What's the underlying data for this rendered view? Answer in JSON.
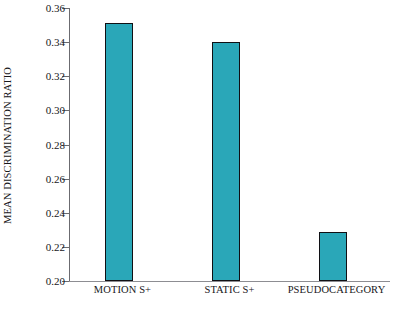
{
  "chart_data": {
    "type": "bar",
    "title": "",
    "xlabel": "",
    "ylabel": "MEAN DISCRIMINATION RATIO",
    "categories": [
      "MOTION S+",
      "STATIC S+",
      "PSEUDOCATEGORY"
    ],
    "values": [
      0.351,
      0.34,
      0.229
    ],
    "ylim": [
      0.2,
      0.36
    ],
    "ytick_step": 0.02,
    "ytick_labels": [
      "0.20",
      "0.22",
      "0.24",
      "0.26",
      "0.28",
      "0.30",
      "0.32",
      "0.34",
      "0.36"
    ],
    "ytick_values": [
      0.2,
      0.22,
      0.24,
      0.26,
      0.28,
      0.3,
      0.32,
      0.34,
      0.36
    ],
    "grid": false,
    "legend": null,
    "bar_color": "#2aa7b8",
    "bar_edge_color": "#101014",
    "axis_color": "#6b6b70",
    "background_color": "#ffffff"
  },
  "axes": {
    "y_title": "MEAN DISCRIMINATION RATIO"
  }
}
